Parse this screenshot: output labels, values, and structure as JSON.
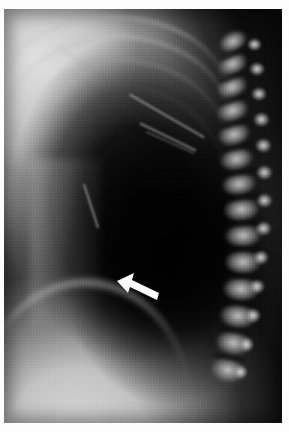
{
  "figure": {
    "kind": "medical-radiograph",
    "modality": "X-ray",
    "view": "lateral chest",
    "caption": "",
    "background_color": "#fdfdfd",
    "plate_color": "#050505"
  },
  "annotations": [
    {
      "id": "arrow-marker",
      "type": "arrow",
      "label": "",
      "color": "#ffffff",
      "direction": "up-left",
      "x": 111,
      "y": 263,
      "width": 46,
      "height": 30,
      "points_at": "retrocardiac lucency / posterior basal region"
    }
  ],
  "plate": {
    "left": 4,
    "top": 9,
    "width": 278,
    "height": 414
  },
  "regions": [
    {
      "name": "anterior-chest-wall-soft-tissue",
      "tone": "bright"
    },
    {
      "name": "shoulder-soft-tissue",
      "tone": "bright"
    },
    {
      "name": "lung-retrocardiac-lucency",
      "tone": "dark"
    },
    {
      "name": "thoracic-spine",
      "tone": "bright"
    },
    {
      "name": "posterior-ribs",
      "tone": "mid"
    },
    {
      "name": "diaphragm",
      "tone": "bright-line"
    },
    {
      "name": "sub-diaphragmatic-abdomen",
      "tone": "bright"
    }
  ],
  "spine": {
    "vertebrae": [
      {
        "x": 214,
        "y": 22,
        "w": 30,
        "h": 21,
        "rot": -26
      },
      {
        "x": 213,
        "y": 44,
        "w": 31,
        "h": 22,
        "rot": -24
      },
      {
        "x": 212,
        "y": 67,
        "w": 32,
        "h": 22,
        "rot": -21
      },
      {
        "x": 212,
        "y": 90,
        "w": 33,
        "h": 23,
        "rot": -18
      },
      {
        "x": 213,
        "y": 114,
        "w": 34,
        "h": 23,
        "rot": -15
      },
      {
        "x": 215,
        "y": 138,
        "w": 35,
        "h": 24,
        "rot": -12
      },
      {
        "x": 217,
        "y": 163,
        "w": 36,
        "h": 24,
        "rot": -9
      },
      {
        "x": 219,
        "y": 188,
        "w": 37,
        "h": 25,
        "rot": -6
      },
      {
        "x": 220,
        "y": 214,
        "w": 38,
        "h": 25,
        "rot": -3
      },
      {
        "x": 220,
        "y": 240,
        "w": 38,
        "h": 26,
        "rot": 0
      },
      {
        "x": 218,
        "y": 267,
        "w": 38,
        "h": 26,
        "rot": 3
      },
      {
        "x": 215,
        "y": 294,
        "w": 38,
        "h": 26,
        "rot": 6
      },
      {
        "x": 211,
        "y": 321,
        "w": 37,
        "h": 26,
        "rot": 9
      },
      {
        "x": 206,
        "y": 348,
        "w": 36,
        "h": 26,
        "rot": 12
      }
    ],
    "spinous_processes": [
      {
        "x": 243,
        "y": 29,
        "w": 15,
        "h": 13
      },
      {
        "x": 245,
        "y": 53,
        "w": 16,
        "h": 14
      },
      {
        "x": 247,
        "y": 78,
        "w": 16,
        "h": 14
      },
      {
        "x": 249,
        "y": 103,
        "w": 17,
        "h": 15
      },
      {
        "x": 251,
        "y": 129,
        "w": 17,
        "h": 15
      },
      {
        "x": 252,
        "y": 156,
        "w": 17,
        "h": 15
      },
      {
        "x": 252,
        "y": 184,
        "w": 17,
        "h": 15
      },
      {
        "x": 251,
        "y": 212,
        "w": 17,
        "h": 15
      },
      {
        "x": 249,
        "y": 241,
        "w": 16,
        "h": 15
      },
      {
        "x": 245,
        "y": 270,
        "w": 16,
        "h": 15
      },
      {
        "x": 241,
        "y": 299,
        "w": 16,
        "h": 15
      },
      {
        "x": 235,
        "y": 328,
        "w": 15,
        "h": 15
      },
      {
        "x": 229,
        "y": 356,
        "w": 15,
        "h": 14
      }
    ],
    "discs": [
      {
        "x": 216,
        "y": 42,
        "w": 28,
        "h": 5,
        "rot": -25
      },
      {
        "x": 215,
        "y": 65,
        "w": 29,
        "h": 5,
        "rot": -22
      },
      {
        "x": 215,
        "y": 88,
        "w": 30,
        "h": 5,
        "rot": -19
      },
      {
        "x": 216,
        "y": 112,
        "w": 31,
        "h": 5,
        "rot": -16
      },
      {
        "x": 218,
        "y": 136,
        "w": 32,
        "h": 5,
        "rot": -13
      },
      {
        "x": 220,
        "y": 161,
        "w": 33,
        "h": 5,
        "rot": -10
      },
      {
        "x": 222,
        "y": 186,
        "w": 34,
        "h": 5,
        "rot": -7
      },
      {
        "x": 223,
        "y": 212,
        "w": 34,
        "h": 5,
        "rot": -4
      },
      {
        "x": 223,
        "y": 238,
        "w": 34,
        "h": 5,
        "rot": -1
      },
      {
        "x": 221,
        "y": 265,
        "w": 34,
        "h": 5,
        "rot": 2
      },
      {
        "x": 218,
        "y": 292,
        "w": 34,
        "h": 5,
        "rot": 5
      },
      {
        "x": 214,
        "y": 319,
        "w": 33,
        "h": 5,
        "rot": 8
      },
      {
        "x": 209,
        "y": 346,
        "w": 32,
        "h": 5,
        "rot": 11
      }
    ]
  },
  "ribs": [
    {
      "x": -6,
      "y": 6,
      "w": 230,
      "h": 78
    },
    {
      "x": 2,
      "y": 26,
      "w": 224,
      "h": 84
    },
    {
      "x": 10,
      "y": 50,
      "w": 214,
      "h": 88
    },
    {
      "x": 18,
      "y": 76,
      "w": 202,
      "h": 92
    }
  ],
  "rib_lines": [
    {
      "x": 54,
      "y": 96,
      "w": 128,
      "h": 5,
      "rot": 36
    },
    {
      "x": 38,
      "y": 70,
      "w": 136,
      "h": 5,
      "rot": 34
    },
    {
      "x": 68,
      "y": 126,
      "w": 120,
      "h": 5,
      "rot": 38
    },
    {
      "x": 92,
      "y": 156,
      "w": 104,
      "h": 4,
      "rot": 40
    }
  ],
  "streaks": [
    {
      "x": 120,
      "y": 106,
      "w": 86,
      "h": 2,
      "rot": 30
    },
    {
      "x": 133,
      "y": 127,
      "w": 62,
      "h": 2,
      "rot": 26
    },
    {
      "x": 140,
      "y": 133,
      "w": 52,
      "h": 1,
      "rot": 24
    },
    {
      "x": 64,
      "y": 196,
      "w": 46,
      "h": 2,
      "rot": 72
    }
  ]
}
